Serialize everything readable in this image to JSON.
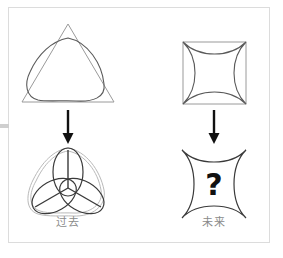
{
  "puzzle": {
    "type": "visual-analogy-sequence",
    "title_visible": false,
    "frame_color": "#dcdcdc",
    "background_color": "#ffffff",
    "answer_placeholder": "?",
    "columns": [
      {
        "id": "past",
        "caption": "过去",
        "caption_color": "#8a8a8a",
        "top_shape": {
          "name": "triangle-with-inscribed-rounded-triangle",
          "outline": "equilateral-triangle",
          "inner": "reuleaux-rounded-triangle"
        },
        "arrow": {
          "name": "down-arrow",
          "direction": "down",
          "color": "#111111"
        },
        "bottom_shape": {
          "name": "rounded-triangle-with-trefoil",
          "outline": "reuleaux-rounded-triangle",
          "inner": "three-petal-trefoil-with-radial-spokes",
          "petal_count": 3
        }
      },
      {
        "id": "future",
        "caption": "未来",
        "caption_color": "#8a8a8a",
        "top_shape": {
          "name": "square-with-inscribed-astroid",
          "outline": "square",
          "inner": "astroid-four-point-concave-star"
        },
        "arrow": {
          "name": "down-arrow",
          "direction": "down",
          "color": "#111111"
        },
        "bottom_shape": {
          "name": "astroid-with-question-mark",
          "outline": "astroid-four-point-concave-star",
          "inner": "question-mark",
          "label": "?"
        }
      }
    ]
  }
}
